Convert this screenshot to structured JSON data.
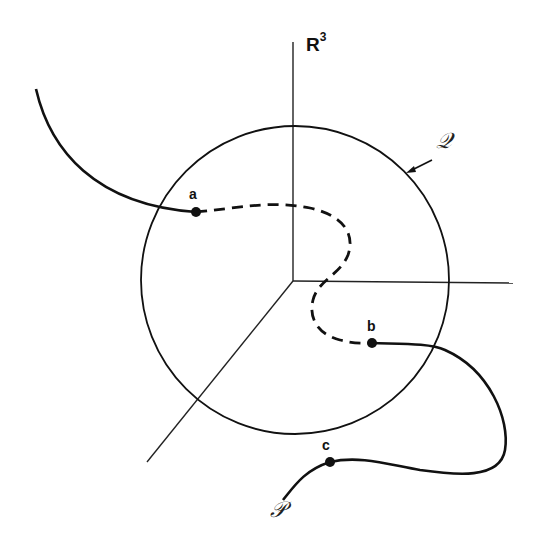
{
  "diagram": {
    "space_label": "R",
    "space_exponent": "3",
    "sphere_label": "𝒬",
    "curve_label": "𝒫",
    "points": [
      {
        "name": "a",
        "label": "a"
      },
      {
        "name": "b",
        "label": "b"
      },
      {
        "name": "c",
        "label": "c"
      }
    ],
    "colors": {
      "background": "#ffffff",
      "stroke": "#111111"
    }
  }
}
